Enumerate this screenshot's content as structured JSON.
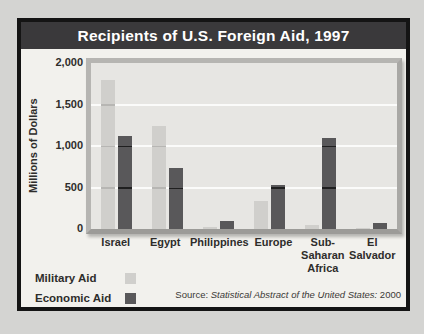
{
  "title": "Recipients of U.S. Foreign Aid, 1997",
  "chart_data": {
    "type": "bar",
    "title": "Recipients of U.S. Foreign Aid, 1997",
    "xlabel": "",
    "ylabel": "Millions of Dollars",
    "ylim": [
      0,
      2000
    ],
    "yticks": [
      0,
      500,
      1000,
      1500,
      2000
    ],
    "ytick_labels": [
      "0",
      "500",
      "1,000",
      "1,500",
      "2,000"
    ],
    "grid": true,
    "legend_position": "bottom-left",
    "categories": [
      "Israel",
      "Egypt",
      "Philippines",
      "Europe",
      "Sub-Saharan Africa",
      "El Salvador"
    ],
    "category_label_lines": [
      [
        "Israel"
      ],
      [
        "Egypt"
      ],
      [
        "Philippines"
      ],
      [
        "Europe"
      ],
      [
        "Sub-Saharan",
        "Africa"
      ],
      [
        "El",
        "Salvador"
      ]
    ],
    "series": [
      {
        "name": "Military Aid",
        "color": "#d0cfcc",
        "values": [
          1800,
          1240,
          25,
          340,
          50,
          15
        ]
      },
      {
        "name": "Economic Aid",
        "color": "#59585a",
        "values": [
          1120,
          740,
          95,
          530,
          1100,
          75
        ]
      }
    ]
  },
  "legend": {
    "items": [
      {
        "label": "Military Aid",
        "color": "#d0cfcc"
      },
      {
        "label": "Economic Aid",
        "color": "#59585a"
      }
    ]
  },
  "source": {
    "prefix": "Source: ",
    "italic": "Statistical Abstract of the United States:",
    "suffix": " 2000"
  },
  "colors": {
    "titlebar_bg": "#3a393b",
    "titlebar_text": "#ffffff",
    "plot_bg": "#e7e6e3",
    "gridline": "#fbfbfa",
    "military_bar": "#d0cfcc",
    "economic_bar": "#59585a",
    "page_bg": "#d4d4d2",
    "card_bg": "#f2f1ed"
  }
}
